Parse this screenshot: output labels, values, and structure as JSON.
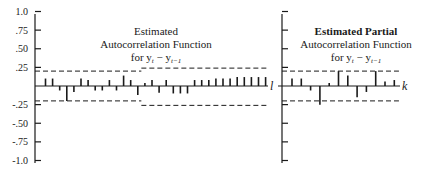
{
  "chart_data": [
    {
      "type": "bar",
      "subtype": "correlogram",
      "title": "Estimated Autocorrelation Function for y_t − y_{t−1}",
      "title_lines": [
        "Estimated",
        "Autocorrelation Function",
        "for y_t − y_{t−1}"
      ],
      "xlabel": "l",
      "ylabel": "",
      "ylim": [
        -1.0,
        1.0
      ],
      "yticks": [
        1.0,
        0.75,
        0.5,
        0.25,
        -0.25,
        -0.5,
        -0.75,
        -1.0
      ],
      "ytick_labels": [
        "1.0",
        ".75",
        ".50",
        ".25",
        "-.25",
        "-.50",
        "-.75",
        "-1.0"
      ],
      "lags": [
        1,
        2,
        3,
        4,
        5,
        6,
        7,
        8,
        9,
        10,
        11,
        12,
        13,
        14,
        15,
        16,
        17,
        18,
        19,
        20,
        21,
        22,
        23,
        24,
        25,
        26,
        27,
        28,
        29,
        30,
        31,
        32
      ],
      "values": [
        0.1,
        0.1,
        -0.06,
        -0.2,
        -0.08,
        0.1,
        0.08,
        -0.06,
        -0.06,
        0.08,
        -0.06,
        0.14,
        0.08,
        -0.12,
        0.04,
        0.08,
        -0.09,
        0.08,
        -0.1,
        -0.1,
        -0.1,
        0.08,
        0.08,
        0.08,
        0.1,
        0.1,
        0.1,
        0.12,
        0.12,
        0.12,
        0.12,
        0.12
      ],
      "confidence_bounds": [
        {
          "lags": [
            1,
            14
          ],
          "upper": 0.2,
          "lower": -0.2
        },
        {
          "lags": [
            15,
            32
          ],
          "upper": 0.24,
          "lower": -0.26
        }
      ],
      "grid": false,
      "legend": null
    },
    {
      "type": "bar",
      "subtype": "correlogram",
      "title": "Estimated Partial Autocorrelation Function for y_t − y_{t−1}",
      "title_lines": [
        "Estimated Partial",
        "Autocorrelation Function",
        "for y_t − y_{t−1}"
      ],
      "xlabel": "k",
      "ylabel": "",
      "ylim": [
        -1.0,
        1.0
      ],
      "lags": [
        1,
        2,
        3,
        4,
        5,
        6,
        7,
        8,
        9,
        10,
        11,
        12
      ],
      "values": [
        0.1,
        0.1,
        -0.06,
        -0.25,
        0.04,
        0.2,
        0.14,
        -0.15,
        -0.08,
        0.2,
        0.06,
        0.08
      ],
      "confidence_bounds": [
        {
          "lags": [
            1,
            12
          ],
          "upper": 0.2,
          "lower": -0.2
        }
      ],
      "grid": false,
      "legend": null
    }
  ],
  "left_panel": {
    "title_lines": [
      "Estimated",
      "Autocorrelation Function"
    ],
    "title_for": "for y",
    "title_sub_t": "t",
    "title_minus": " − y",
    "title_sub_t1": "t−1",
    "axis_label": "l",
    "tick_labels": [
      "1.0",
      ".75",
      ".50",
      ".25",
      "-.25",
      "-.50",
      "-.75",
      "-1.0"
    ]
  },
  "right_panel": {
    "title_lines": [
      "Estimated Partial",
      "Autocorrelation Function"
    ],
    "title_for": "for y",
    "title_sub_t": "t",
    "title_minus": " − y",
    "title_sub_t1": "t−1",
    "axis_label": "k"
  },
  "colors": {
    "ink": "#1a1a1a",
    "background": "#ffffff"
  }
}
